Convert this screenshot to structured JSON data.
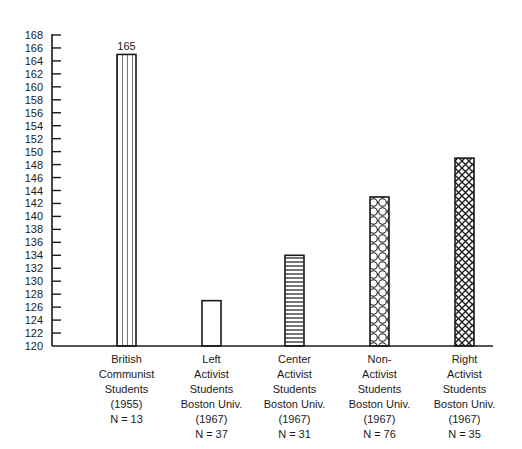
{
  "chart_data": {
    "type": "bar",
    "title": "",
    "xlabel": "",
    "ylabel": "",
    "ylim": [
      120,
      168
    ],
    "yticks": [
      120,
      122,
      124,
      126,
      128,
      130,
      132,
      134,
      136,
      138,
      140,
      142,
      144,
      146,
      148,
      150,
      152,
      154,
      156,
      158,
      160,
      162,
      164,
      166,
      168
    ],
    "grid": false,
    "legend": null,
    "categories": [
      "British Communist Students (1955) N = 13",
      "Left Activist Students Boston Univ. (1967) N = 37",
      "Center Activist Students Boston Univ. (1967) N = 31",
      "Non-Activist Students Boston Univ. (1967) N = 76",
      "Right Activist Students Boston Univ. (1967) N = 35"
    ],
    "values": [
      165,
      127,
      134,
      143,
      149
    ],
    "annotations": [
      {
        "category_index": 0,
        "text": "165"
      }
    ],
    "bars": [
      {
        "label_lines": [
          "British",
          "Communist",
          "Students",
          "(1955)",
          "N = 13"
        ],
        "value": 165,
        "pattern": "vertical-lines",
        "value_label": "165"
      },
      {
        "label_lines": [
          "Left",
          "Activist",
          "Students",
          "Boston Univ.",
          "(1967)",
          "N = 37"
        ],
        "value": 127,
        "pattern": "empty",
        "value_label": null
      },
      {
        "label_lines": [
          "Center",
          "Activist",
          "Students",
          "Boston Univ.",
          "(1967)",
          "N = 31"
        ],
        "value": 134,
        "pattern": "horizontal-lines",
        "value_label": null
      },
      {
        "label_lines": [
          "Non-",
          "Activist",
          "Students",
          "Boston Univ.",
          "(1967)",
          "N = 76"
        ],
        "value": 143,
        "pattern": "circles",
        "value_label": null
      },
      {
        "label_lines": [
          "Right",
          "Activist",
          "Students",
          "Boston Univ.",
          "(1967)",
          "N = 35"
        ],
        "value": 149,
        "pattern": "crosshatch",
        "value_label": null
      }
    ]
  },
  "colors": {
    "ink": "#1a1a1a",
    "background": "#ffffff"
  }
}
